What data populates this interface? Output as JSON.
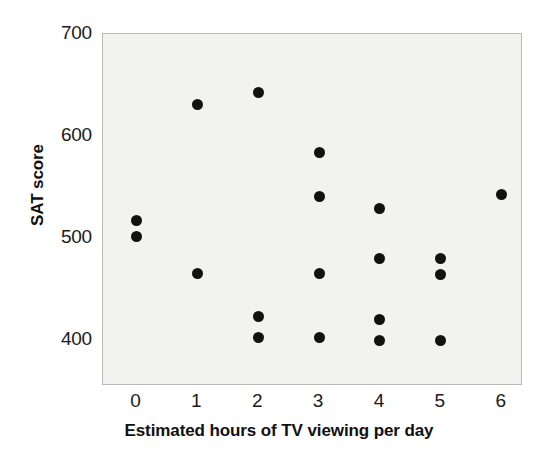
{
  "chart_data": {
    "type": "scatter",
    "title": "",
    "xlabel": "Estimated hours of TV viewing per day",
    "ylabel": "SAT score",
    "xlim": [
      -0.55,
      6.35
    ],
    "ylim": [
      355,
      700
    ],
    "xticks": [
      0,
      1,
      2,
      3,
      4,
      5,
      6
    ],
    "xtick_labels": [
      "0",
      "1",
      "2",
      "3",
      "4",
      "5",
      "6"
    ],
    "yticks": [
      400,
      500,
      600,
      700
    ],
    "ytick_labels": [
      "400",
      "500",
      "600",
      "700"
    ],
    "grid": false,
    "legend": "none",
    "marker": "filled-circle",
    "marker_color": "#111111",
    "plot_background": "#f2f2f0",
    "frame_color": "#b9b9b7",
    "points": [
      {
        "x": 0,
        "y": 517
      },
      {
        "x": 0,
        "y": 502
      },
      {
        "x": 1,
        "y": 631
      },
      {
        "x": 1,
        "y": 465
      },
      {
        "x": 2,
        "y": 643
      },
      {
        "x": 2,
        "y": 423
      },
      {
        "x": 2,
        "y": 403
      },
      {
        "x": 3,
        "y": 584
      },
      {
        "x": 3,
        "y": 541
      },
      {
        "x": 3,
        "y": 465
      },
      {
        "x": 3,
        "y": 403
      },
      {
        "x": 4,
        "y": 529
      },
      {
        "x": 4,
        "y": 480
      },
      {
        "x": 4,
        "y": 420
      },
      {
        "x": 4,
        "y": 400
      },
      {
        "x": 5,
        "y": 480
      },
      {
        "x": 5,
        "y": 464
      },
      {
        "x": 5,
        "y": 400
      },
      {
        "x": 6,
        "y": 543
      }
    ]
  }
}
